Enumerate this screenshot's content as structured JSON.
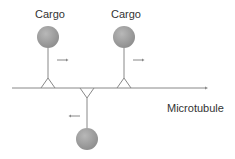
{
  "diagram": {
    "labels": {
      "cargo_1": "Cargo",
      "cargo_2": "Cargo",
      "track": "Microtubule"
    },
    "colors": {
      "cargo_fill": "#9e9e9e",
      "line": "#888888",
      "arrow": "#888888",
      "text": "#333333"
    },
    "motors": [
      {
        "id": "motor-1",
        "side": "top",
        "direction": "right",
        "label": "Cargo"
      },
      {
        "id": "motor-2",
        "side": "top",
        "direction": "right",
        "label": "Cargo"
      },
      {
        "id": "motor-3",
        "side": "bottom",
        "direction": "left",
        "label": ""
      }
    ]
  }
}
